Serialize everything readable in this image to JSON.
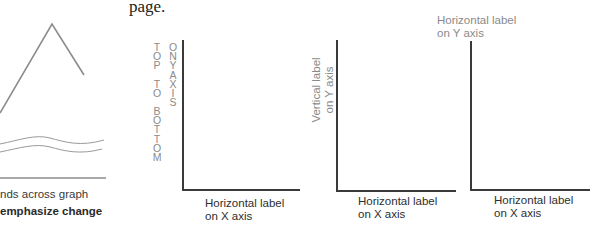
{
  "left_fragment": {
    "caption_line1": "nds across graph",
    "caption_line2": "emphasize change",
    "colors": {
      "line": "#8c8c8c",
      "axis": "#555555"
    }
  },
  "page_text": "page.",
  "graphs": [
    {
      "name": "top-to-bottom",
      "y_label_stack_1": [
        "T",
        "O",
        "P",
        "",
        "T",
        "O",
        "",
        "B",
        "O",
        "T",
        "T",
        "O",
        "M"
      ],
      "y_label_stack_2": [
        "O",
        "N",
        "",
        "Y",
        "",
        "A",
        "X",
        "I",
        "S"
      ],
      "x_label_line1": "Horizontal label",
      "x_label_line2": "on X axis"
    },
    {
      "name": "vertical-label",
      "y_label_line1": "Vertical label",
      "y_label_line2": "on Y axis",
      "x_label_line1": "Horizontal label",
      "x_label_line2": "on X axis"
    },
    {
      "name": "horizontal-top-label",
      "y_label_line1": "Horizontal label",
      "y_label_line2": "on Y axis",
      "x_label_line1": "Horizontal label",
      "x_label_line2": "on X axis"
    }
  ],
  "colors": {
    "text_gray": "#8a8a8a",
    "text_dark": "#2e2e2e",
    "axis": "#3a3a3a"
  }
}
